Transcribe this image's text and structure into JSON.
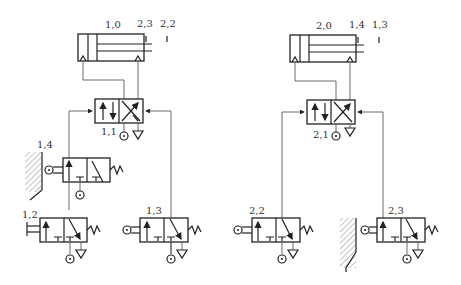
{
  "diagram": {
    "type": "pneumatic-circuit",
    "circuit1": {
      "cylinder_label": "1,0",
      "limit_labels": [
        "2,3",
        "2,2"
      ],
      "main_valve_label": "1,1",
      "roller_valve_label": "1,4",
      "push_valve_label": "1,2",
      "roller_valve2_label": "1,3"
    },
    "circuit2": {
      "cylinder_label": "2,0",
      "limit_labels": [
        "1,4",
        "1,3"
      ],
      "main_valve_label": "2,1",
      "roller_valve_label": "2,2",
      "roller_valve2_label": "2,3"
    }
  }
}
